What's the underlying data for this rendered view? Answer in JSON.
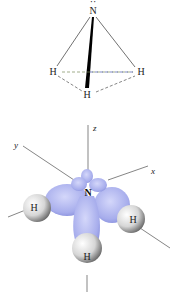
{
  "top_diagram": {
    "central_atom": "N",
    "lone_pair_marker": "··",
    "hydrogens": [
      {
        "id": "h-left",
        "label": "H"
      },
      {
        "id": "h-right",
        "label": "H"
      },
      {
        "id": "h-front",
        "label": "H"
      }
    ]
  },
  "orbital_diagram": {
    "axes": {
      "z": "z",
      "y": "y",
      "x": "x"
    },
    "central_atom": "N",
    "hydrogens": [
      {
        "id": "h-left",
        "label": "H"
      },
      {
        "id": "h-right",
        "label": "H"
      },
      {
        "id": "h-bottom",
        "label": "H"
      }
    ],
    "colors": {
      "orbital": "#aab0ee",
      "orbital_dark": "#7d85d8",
      "hydrogen_sphere": "#d8d8d8",
      "line": "#333333",
      "dash_left": "#7a8a3a",
      "dash_right": "#4a5ab0"
    }
  }
}
